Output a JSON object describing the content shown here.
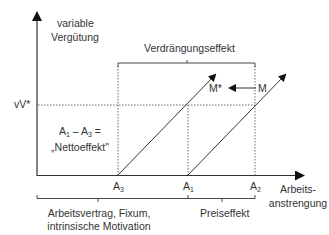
{
  "axes": {
    "y_label_line1": "variable",
    "y_label_line2": "Vergütung",
    "x_label_line1": "Arbeits-",
    "x_label_line2": "anstrengung",
    "y_marker": "vV*"
  },
  "points": {
    "a3": "A",
    "a3_sub": "3",
    "a1": "A",
    "a1_sub": "1",
    "a2": "A",
    "a2_sub": "2",
    "m_star": "M*",
    "m": "M"
  },
  "annotations": {
    "crowding_out": "Verdrängungseffekt",
    "net_effect_line1_a": "A",
    "net_effect_line1_sub1": "1",
    "net_effect_line1_mid": " – A",
    "net_effect_line1_sub2": "3",
    "net_effect_line1_end": " =",
    "net_effect_line2": "„Nettoeffekt\"",
    "contract_line1": "Arbeitsvertrag, Fixum,",
    "contract_line2": "intrinsische Motivation",
    "price_effect": "Preiseffekt"
  },
  "colors": {
    "line": "#333333",
    "dotted": "#444444"
  }
}
